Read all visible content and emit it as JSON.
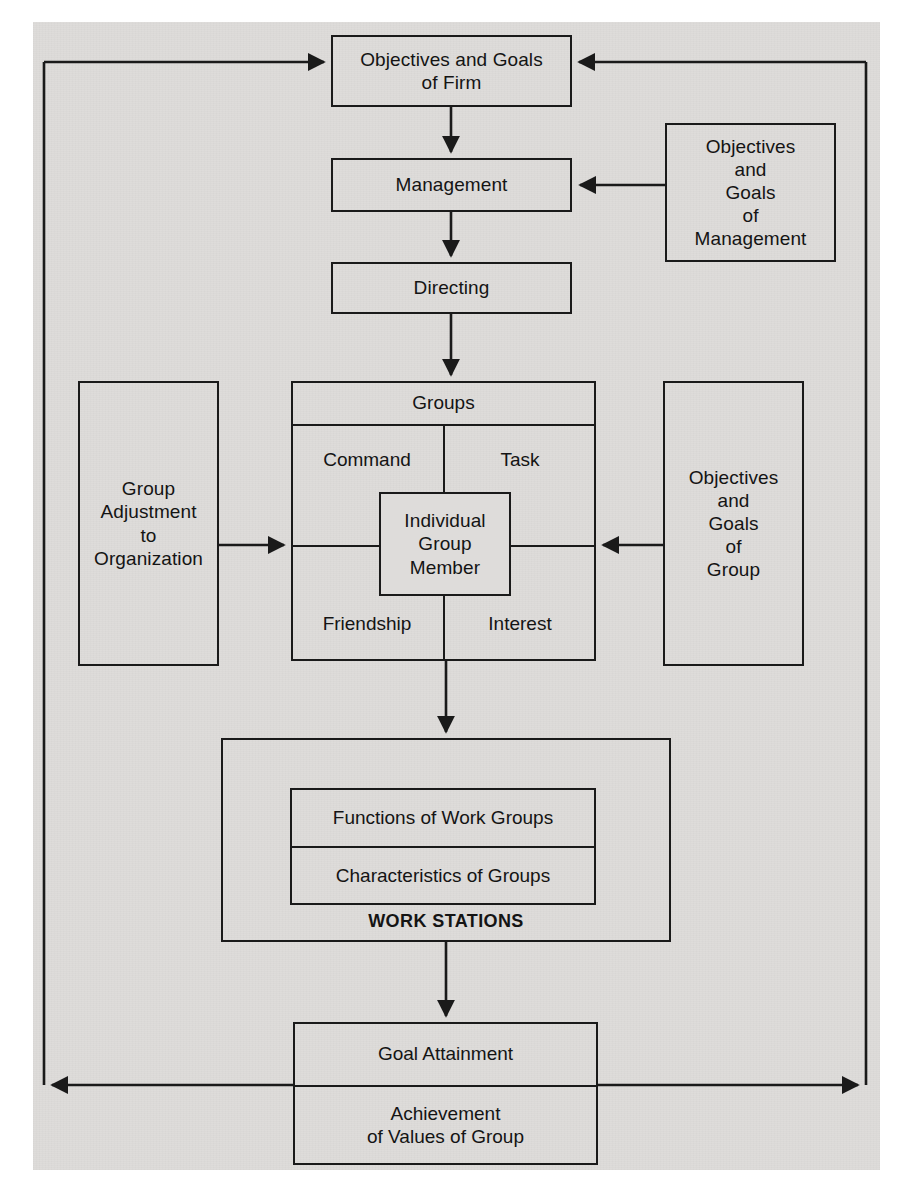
{
  "diagram": {
    "page_background": "#dedcda",
    "line_color": "#1a1a1a",
    "nodes": {
      "objectives_goals_firm": "Objectives and Goals\nof Firm",
      "management": "Management",
      "directing": "Directing",
      "objectives_goals_management": "Objectives\nand\nGoals\nof\nManagement",
      "group_adjustment_to_organization": "Group\nAdjustment\nto\nOrganization",
      "objectives_goals_group": "Objectives\nand\nGoals\nof\nGroup",
      "groups_header": "Groups",
      "groups_quadrant_command": "Command",
      "groups_quadrant_task": "Task",
      "groups_quadrant_friendship": "Friendship",
      "groups_quadrant_interest": "Interest",
      "individual_group_member": "Individual\nGroup\nMember",
      "functions_of_work_groups": "Functions of Work Groups",
      "characteristics_of_groups": "Characteristics of Groups",
      "work_stations": "WORK STATIONS",
      "goal_attainment": "Goal Attainment",
      "achievement_of_values_of_group": "Achievement\nof Values of Group"
    },
    "connectors": [
      {
        "name": "firm-to-management",
        "from": "objectives_goals_firm",
        "to": "management",
        "direction": "down"
      },
      {
        "name": "management-to-directing",
        "from": "management",
        "to": "directing",
        "direction": "down"
      },
      {
        "name": "objmgmt-to-management",
        "from": "objectives_goals_management",
        "to": "management",
        "direction": "left"
      },
      {
        "name": "directing-to-groups",
        "from": "directing",
        "to": "groups_header",
        "direction": "down"
      },
      {
        "name": "groupadjust-to-groups",
        "from": "group_adjustment_to_organization",
        "to": "groups_header",
        "direction": "right"
      },
      {
        "name": "objgroup-to-groups",
        "from": "objectives_goals_group",
        "to": "groups_header",
        "direction": "left"
      },
      {
        "name": "groups-to-workstations",
        "from": "groups_header",
        "to": "work_stations",
        "direction": "down"
      },
      {
        "name": "workstations-to-goal",
        "from": "work_stations",
        "to": "goal_attainment",
        "direction": "down"
      },
      {
        "name": "feedback-left-loop",
        "from": "achievement_of_values_of_group",
        "to": "objectives_goals_firm",
        "direction": "left-up-right"
      },
      {
        "name": "feedback-right-loop",
        "from": "achievement_of_values_of_group",
        "to": "objectives_goals_firm",
        "direction": "right-up-left"
      }
    ]
  }
}
